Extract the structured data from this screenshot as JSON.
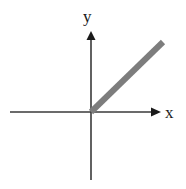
{
  "figure": {
    "background_color": "#ffffff",
    "width": 186,
    "height": 189
  },
  "axes": {
    "x_label": "x",
    "y_label": "y",
    "axis_color": "#3a3a3a",
    "axis_stroke_width": 1.6,
    "origin": {
      "x": 91,
      "y": 112
    },
    "x_axis": {
      "start_x": 10,
      "end_x": 160,
      "y": 112,
      "arrow": "right"
    },
    "y_axis": {
      "x": 91,
      "start_y": 180,
      "end_y": 31,
      "arrow": "up"
    }
  },
  "chart_data": {
    "type": "line",
    "xlabel": "x",
    "ylabel": "y",
    "grid": false,
    "legend": null,
    "xlim": [
      -1.12,
      0.96
    ],
    "ylim": [
      -0.94,
      1.16
    ],
    "series": [
      {
        "name": "ray",
        "color": "#7d7d7d",
        "line_width": 6,
        "description": "Thick gray ray starting at the origin and extending up and to the right with slope 1 (about 45 degrees); nothing is drawn for x less than 0.",
        "slope": 1,
        "intercept": 0,
        "x": [
          0.0,
          1.0
        ],
        "y": [
          0.0,
          1.0
        ],
        "pixel_start": {
          "x": 91,
          "y": 112
        },
        "pixel_end": {
          "x": 163,
          "y": 42
        }
      }
    ],
    "annotations": [
      {
        "text": "y",
        "pixel_x": 89,
        "pixel_y": 17,
        "role": "y-axis-label"
      },
      {
        "text": "x",
        "pixel_x": 171,
        "pixel_y": 113,
        "role": "x-axis-label"
      }
    ]
  },
  "ray": {
    "color": "#7d7d7d",
    "stroke_width": 6,
    "start": {
      "x": 91,
      "y": 112
    },
    "end": {
      "x": 163,
      "y": 42
    }
  }
}
